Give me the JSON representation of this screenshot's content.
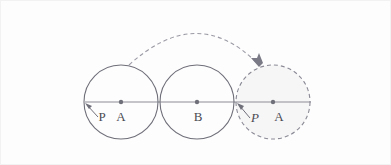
{
  "figure": {
    "canvas": {
      "width": 391,
      "height": 165
    },
    "background_color": "#fdfdfd",
    "border_color": "#f2f2f2",
    "stroke_color": "#6f6f7a",
    "dash_color": "#8a8a96",
    "dot_color": "#6f6f7a",
    "fill_color": "#f6f6f7",
    "label_color": "#4a4a52",
    "baseline": {
      "name": "baseline",
      "y": 101,
      "x_start": 84,
      "x_end": 310
    },
    "circles": [
      {
        "id": "circle-start",
        "style": "solid",
        "cx": 120,
        "cy": 101,
        "r": 37,
        "filled": false
      },
      {
        "id": "circle-middle",
        "style": "solid",
        "cx": 196,
        "cy": 101,
        "r": 37,
        "filled": false
      },
      {
        "id": "circle-end",
        "style": "dashed",
        "cx": 272,
        "cy": 101,
        "r": 37,
        "filled": true
      }
    ],
    "center_dots": [
      {
        "id": "dot-a-left",
        "cx": 120,
        "cy": 101,
        "r": 2.2
      },
      {
        "id": "dot-b",
        "cx": 196,
        "cy": 101,
        "r": 2.2
      },
      {
        "id": "dot-a-right",
        "cx": 272,
        "cy": 101,
        "r": 2.2
      }
    ],
    "labels": [
      {
        "id": "label-p-left",
        "text": "P",
        "x": 101,
        "y": 119,
        "italic": false
      },
      {
        "id": "label-a-left",
        "text": "A",
        "x": 120,
        "y": 119,
        "italic": false
      },
      {
        "id": "label-b",
        "text": "B",
        "x": 196,
        "y": 119,
        "italic": false
      },
      {
        "id": "label-p-right",
        "text": "P",
        "x": 253,
        "y": 119,
        "italic": true
      },
      {
        "id": "label-a-right",
        "text": "A",
        "x": 277,
        "y": 119,
        "italic": false
      }
    ],
    "pointer_arrows": [
      {
        "id": "pointer-p-left",
        "from_x": 96,
        "from_y": 115,
        "to_x": 85,
        "to_y": 103
      },
      {
        "id": "pointer-p-right",
        "from_x": 248,
        "from_y": 116,
        "to_x": 236,
        "to_y": 103
      }
    ],
    "motion_arc": {
      "id": "motion-arc",
      "start_x": 128,
      "start_y": 64,
      "control_x": 196,
      "control_y": 2,
      "end_x": 256,
      "end_y": 62,
      "arrow_tip_x": 258,
      "arrow_tip_y": 64,
      "dash_pattern": "4 3"
    }
  }
}
